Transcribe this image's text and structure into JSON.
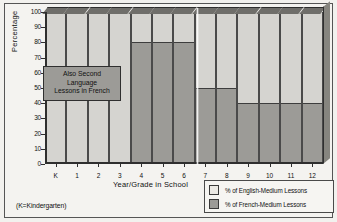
{
  "chart_data": {
    "type": "bar",
    "stacked": true,
    "title": "",
    "xlabel": "Year/Grade in School",
    "ylabel": "Percentage",
    "ylim": [
      0,
      100
    ],
    "ytick_step": 10,
    "yticks": [
      "100",
      "90",
      "80",
      "70",
      "60",
      "50",
      "40",
      "30",
      "20",
      "10",
      "0"
    ],
    "categories": [
      "K",
      "1",
      "2",
      "3",
      "4",
      "5",
      "6",
      "7",
      "8",
      "9",
      "10",
      "11",
      "12"
    ],
    "series": [
      {
        "name": "% of English-Medium Lessons",
        "color": "#d5d4d0",
        "values": [
          100,
          100,
          100,
          100,
          20,
          20,
          20,
          50,
          50,
          60,
          60,
          60,
          60
        ]
      },
      {
        "name": "% of French-Medium Lessons",
        "color": "#9c9b97",
        "values": [
          0,
          0,
          0,
          0,
          80,
          80,
          80,
          50,
          50,
          40,
          40,
          40,
          40
        ]
      }
    ],
    "grid": false,
    "legend_position": "bottom-right",
    "annotations": [
      {
        "name": "also-second-language-callout",
        "text": "Also Second Language Lessons in French",
        "lines": [
          "Also Second",
          "Language",
          "Lessons in French"
        ],
        "spans_categories": [
          "K",
          "1",
          "2",
          "3"
        ]
      }
    ]
  },
  "axes": {
    "y_title": "Percentage",
    "x_title": "Year/Grade in School"
  },
  "legend": {
    "items": [
      {
        "label": "% of English-Medium Lessons",
        "swatch": "english"
      },
      {
        "label": "% of French-Medium Lessons",
        "swatch": "french"
      }
    ]
  },
  "footnote": "(K=Kindergarten)"
}
